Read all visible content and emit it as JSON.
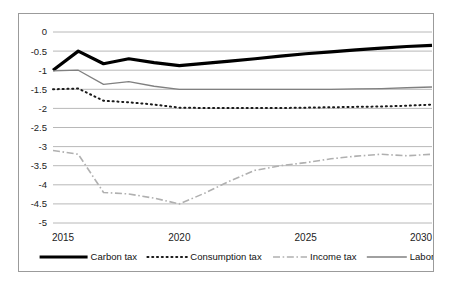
{
  "chart_data": {
    "type": "line",
    "title": "",
    "subtitle": "",
    "xlabel": "",
    "ylabel": "",
    "x": [
      2015,
      2016,
      2017,
      2018,
      2019,
      2020,
      2021,
      2022,
      2023,
      2024,
      2025,
      2026,
      2027,
      2028,
      2029,
      2030
    ],
    "xlim": [
      2015,
      2030
    ],
    "ylim": [
      -5,
      0
    ],
    "xticks": [
      "2015",
      "2020",
      "2025",
      "2030"
    ],
    "xtick_values": [
      2015,
      2020,
      2025,
      2030
    ],
    "yticks": [
      "0",
      "-0.5",
      "-1",
      "-1.5",
      "-2",
      "-2.5",
      "-3",
      "-3.5",
      "-4",
      "-4.5",
      "-5"
    ],
    "ytick_values": [
      0,
      -0.5,
      -1,
      -1.5,
      -2,
      -2.5,
      -3,
      -3.5,
      -4,
      -4.5,
      -5
    ],
    "grid": true,
    "grid_axis": "y",
    "legend_position": "bottom",
    "series": [
      {
        "name": "Carbon tax",
        "style": "solid-thick",
        "color": "#000000",
        "width": 3.2,
        "values": [
          -1.0,
          -0.5,
          -0.83,
          -0.7,
          -0.8,
          -0.88,
          -0.82,
          -0.76,
          -0.7,
          -0.63,
          -0.57,
          -0.52,
          -0.47,
          -0.42,
          -0.38,
          -0.35
        ]
      },
      {
        "name": "Consumption tax",
        "style": "dotted",
        "color": "#1a1a1a",
        "width": 2.0,
        "values": [
          -1.5,
          -1.48,
          -1.8,
          -1.84,
          -1.9,
          -1.98,
          -1.99,
          -1.99,
          -1.99,
          -1.99,
          -1.98,
          -1.97,
          -1.96,
          -1.95,
          -1.93,
          -1.9
        ]
      },
      {
        "name": "Income tax",
        "style": "dashdot",
        "color": "#b0b0b0",
        "width": 1.6,
        "values": [
          -3.1,
          -3.2,
          -4.2,
          -4.24,
          -4.35,
          -4.5,
          -4.22,
          -3.9,
          -3.62,
          -3.5,
          -3.42,
          -3.32,
          -3.25,
          -3.2,
          -3.24,
          -3.2
        ]
      },
      {
        "name": "Labor tax",
        "style": "solid-thin",
        "color": "#808080",
        "width": 1.3,
        "values": [
          -1.02,
          -1.0,
          -1.37,
          -1.3,
          -1.42,
          -1.5,
          -1.5,
          -1.5,
          -1.5,
          -1.5,
          -1.5,
          -1.5,
          -1.49,
          -1.48,
          -1.46,
          -1.44
        ]
      }
    ]
  }
}
